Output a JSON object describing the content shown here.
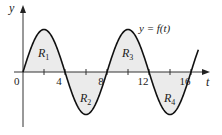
{
  "chart_data": {
    "type": "line",
    "title": "",
    "xlabel": "t",
    "ylabel": "y",
    "curve_label": "y = f(t)",
    "function": "sinusoid, period 8, zero at t=0",
    "x_ticks": [
      2,
      4,
      6,
      8,
      10,
      12,
      14,
      16
    ],
    "x_tick_labels": [
      {
        "t": 0,
        "label": "0"
      },
      {
        "t": 4,
        "label": "4"
      },
      {
        "t": 8,
        "label": "8"
      },
      {
        "t": 12,
        "label": "12"
      },
      {
        "t": 16,
        "label": "16"
      }
    ],
    "x_range": [
      0,
      16.7
    ],
    "amplitude": 1,
    "period": 8,
    "regions": [
      {
        "name": "R",
        "sub": "1",
        "t_start": 0,
        "t_end": 4,
        "sign": "positive",
        "label_t": 2,
        "label_y": 0.45
      },
      {
        "name": "R",
        "sub": "2",
        "t_start": 4,
        "t_end": 8,
        "sign": "negative",
        "label_t": 6,
        "label_y": -0.6
      },
      {
        "name": "R",
        "sub": "3",
        "t_start": 8,
        "t_end": 12,
        "sign": "positive",
        "label_t": 10,
        "label_y": 0.45
      },
      {
        "name": "R",
        "sub": "4",
        "t_start": 12,
        "t_end": 16,
        "sign": "negative",
        "label_t": 14,
        "label_y": -0.6
      }
    ],
    "grid": false,
    "legend": "none",
    "colors": {
      "curve": "#111111",
      "fill": "#ebebeb",
      "axis": "#333333"
    }
  }
}
